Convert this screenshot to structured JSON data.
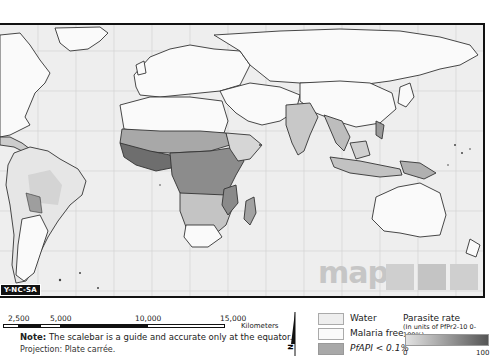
{
  "map": {
    "title": "Plasmodium falciparum parasite rate world map",
    "license_label": "Y-NC-SA",
    "logo_text": "map",
    "gridlines": {
      "vertical_spacing_px": 38,
      "horizontal_spacing_px": 40
    }
  },
  "scalebar": {
    "ticks": [
      "2,500",
      "5,000",
      "10,000",
      "15,000"
    ],
    "unit": "Kilometers"
  },
  "notes": {
    "note_label": "Note:",
    "note_text": "The scalebar is a guide and accurate only at the equator.",
    "projection": "Projection: Plate carrée."
  },
  "north_arrow": {
    "label": "N"
  },
  "legend": {
    "categories": [
      {
        "label": "Water",
        "color": "#eeeeee"
      },
      {
        "label": "Malaria free",
        "color": "#fafafa"
      },
      {
        "label": "PfAPI < 0.1%",
        "color": "#a8a8a8"
      }
    ],
    "parasite_rate": {
      "title": "Parasite rate",
      "subtitle": "(In units of PfPr2-10 0-100%)",
      "min": "0",
      "max": "100",
      "color_low": "#e2e2e2",
      "color_high": "#555555"
    }
  }
}
